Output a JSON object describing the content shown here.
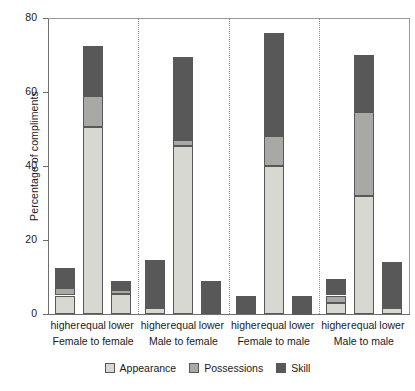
{
  "chart_data": {
    "type": "bar",
    "subtype": "stacked-bar-grouped",
    "title": "",
    "xlabel": "",
    "ylabel": "Percentage of compliments",
    "ylim": [
      0,
      80
    ],
    "yticks": [
      0,
      20,
      40,
      60,
      80
    ],
    "ytick_labels": [
      "0",
      "20",
      "40",
      "60",
      "80"
    ],
    "grid": false,
    "legend_position": "bottom",
    "legend": [
      "Appearance",
      "Possessions",
      "Skill"
    ],
    "series": [
      {
        "name": "Appearance",
        "color": "#d8d8d2",
        "values": [
          5.0,
          50.5,
          5.5,
          1.5,
          45.5,
          0.0,
          0.5,
          40.0,
          0.3,
          3.0,
          32.0,
          1.5
        ]
      },
      {
        "name": "Possessions",
        "color": "#a8a8a4",
        "values": [
          2.0,
          8.5,
          1.0,
          0.5,
          1.5,
          0.0,
          0.3,
          8.0,
          0.2,
          2.0,
          22.5,
          0.5
        ]
      },
      {
        "name": "Skill",
        "color": "#585858",
        "values": [
          5.5,
          13.5,
          2.5,
          12.5,
          22.5,
          9.0,
          4.2,
          28.0,
          4.5,
          4.5,
          15.5,
          12.0
        ]
      }
    ],
    "groups": [
      {
        "label": "Female to female",
        "categories": [
          "higher",
          "equal",
          "lower"
        ],
        "totals": [
          12.5,
          72.5,
          9.0
        ]
      },
      {
        "label": "Male to female",
        "categories": [
          "higher",
          "equal",
          "lower"
        ],
        "totals": [
          14.5,
          69.5,
          9.0
        ]
      },
      {
        "label": "Female to male",
        "categories": [
          "higher",
          "equal",
          "lower"
        ],
        "totals": [
          5.0,
          76.0,
          5.0
        ]
      },
      {
        "label": "Male to male",
        "categories": [
          "higher",
          "equal",
          "lower"
        ],
        "totals": [
          9.5,
          70.0,
          14.0
        ]
      }
    ],
    "bars": [
      {
        "group": "Female to female",
        "category": "higher",
        "Appearance": 5.0,
        "Possessions": 2.0,
        "Skill": 5.5,
        "total": 12.5
      },
      {
        "group": "Female to female",
        "category": "equal",
        "Appearance": 50.5,
        "Possessions": 8.5,
        "Skill": 13.5,
        "total": 72.5
      },
      {
        "group": "Female to female",
        "category": "lower",
        "Appearance": 5.5,
        "Possessions": 1.0,
        "Skill": 2.5,
        "total": 9.0
      },
      {
        "group": "Male to female",
        "category": "higher",
        "Appearance": 1.5,
        "Possessions": 0.5,
        "Skill": 12.5,
        "total": 14.5
      },
      {
        "group": "Male to female",
        "category": "equal",
        "Appearance": 45.5,
        "Possessions": 1.5,
        "Skill": 22.5,
        "total": 69.5
      },
      {
        "group": "Male to female",
        "category": "lower",
        "Appearance": 0.0,
        "Possessions": 0.0,
        "Skill": 9.0,
        "total": 9.0
      },
      {
        "group": "Female to male",
        "category": "higher",
        "Appearance": 0.5,
        "Possessions": 0.3,
        "Skill": 4.2,
        "total": 5.0
      },
      {
        "group": "Female to male",
        "category": "equal",
        "Appearance": 40.0,
        "Possessions": 8.0,
        "Skill": 28.0,
        "total": 76.0
      },
      {
        "group": "Female to male",
        "category": "lower",
        "Appearance": 0.3,
        "Possessions": 0.2,
        "Skill": 4.5,
        "total": 5.0
      },
      {
        "group": "Male to male",
        "category": "higher",
        "Appearance": 3.0,
        "Possessions": 2.0,
        "Skill": 4.5,
        "total": 9.5
      },
      {
        "group": "Male to male",
        "category": "equal",
        "Appearance": 32.0,
        "Possessions": 22.5,
        "Skill": 15.5,
        "total": 70.0
      },
      {
        "group": "Male to male",
        "category": "lower",
        "Appearance": 1.5,
        "Possessions": 0.5,
        "Skill": 12.0,
        "total": 14.0
      }
    ]
  },
  "axis": {
    "y_title": "Percentage of compliments"
  },
  "colors": {
    "appearance": "#d8d8d2",
    "possessions": "#a8a8a4",
    "skill": "#585858",
    "outline": "#585858",
    "axis": "#6e6e6e",
    "frame": "#9a9a9a",
    "divider": "#8a8a8a"
  }
}
